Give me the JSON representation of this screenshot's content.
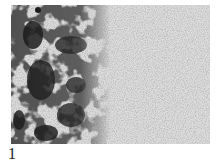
{
  "figure": {
    "panel_label": "1",
    "image_description": "Grayscale micrograph: dense dark clustered aggregates on the left, fine speckled grain texture fading lighter toward the right",
    "colors": {
      "background": "#d9d9d9",
      "dark_clusters": "#1a1a1a",
      "speckle": "#8a8a8a"
    }
  }
}
